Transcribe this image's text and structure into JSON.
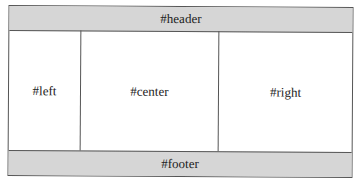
{
  "header": {
    "label": "#header"
  },
  "columns": {
    "left": {
      "label": "#left"
    },
    "center": {
      "label": "#center"
    },
    "right": {
      "label": "#right"
    }
  },
  "footer": {
    "label": "#footer"
  },
  "colors": {
    "band": "#d6d6d6",
    "border": "#555555",
    "background": "#ffffff"
  }
}
